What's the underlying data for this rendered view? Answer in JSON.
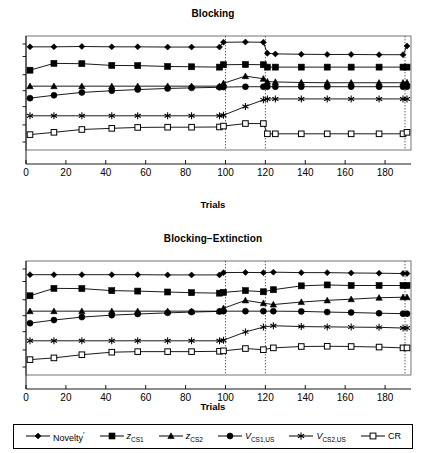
{
  "figure": {
    "width": 426,
    "height": 453,
    "background": "#ffffff",
    "line_color": "#000000",
    "gridline_color": "#555555"
  },
  "legend": {
    "name": "series-legend",
    "position": "bottom",
    "border": true,
    "entries": [
      {
        "key": "novelty",
        "label": "Novelty'",
        "marker": "diamond",
        "marker_filled": true
      },
      {
        "key": "z_cs1",
        "label": "zCS1",
        "marker": "square",
        "marker_filled": true
      },
      {
        "key": "z_cs2",
        "label": "zCS2",
        "marker": "triangle",
        "marker_filled": true
      },
      {
        "key": "v_cs1_us",
        "label": "VCS1,US",
        "marker": "circle",
        "marker_filled": true
      },
      {
        "key": "v_cs2_us",
        "label": "VCS2,US",
        "marker": "asterisk",
        "marker_filled": true
      },
      {
        "key": "cr",
        "label": "CR",
        "marker": "square-open",
        "marker_filled": false
      }
    ]
  },
  "chart_data": [
    {
      "id": "blocking",
      "type": "line",
      "title": "Blocking",
      "xlabel": "Trials",
      "ylabel": "",
      "xlim": [
        0,
        193
      ],
      "ylim": [
        0,
        1
      ],
      "xticks": [
        0,
        20,
        40,
        60,
        80,
        100,
        120,
        140,
        160,
        180
      ],
      "xticklabels": [
        "0",
        "20",
        "40",
        "60",
        "80",
        "100",
        "120",
        "140",
        "160",
        "180"
      ],
      "yticks": [
        0.07,
        0.22,
        0.38,
        0.52,
        0.66,
        0.82,
        0.93
      ],
      "yticklabels": [
        "",
        "",
        "",
        "",
        "",
        "",
        ""
      ],
      "grid": false,
      "vlines": [
        100,
        120,
        190
      ],
      "vline_style": "dotted",
      "x": [
        2,
        14,
        28,
        43,
        56,
        71,
        83,
        97,
        99,
        110,
        119,
        121,
        125,
        138,
        151,
        163,
        177,
        189,
        191
      ],
      "series": [
        {
          "name": "Novelty'",
          "marker": "diamond",
          "values": [
            0.905,
            0.905,
            0.908,
            0.905,
            0.905,
            0.903,
            0.903,
            0.903,
            0.945,
            0.947,
            0.945,
            0.848,
            0.843,
            0.84,
            0.838,
            0.838,
            0.836,
            0.836,
            0.912
          ]
        },
        {
          "name": "zCS1",
          "marker": "square",
          "values": [
            0.7,
            0.76,
            0.757,
            0.742,
            0.74,
            0.733,
            0.73,
            0.727,
            0.748,
            0.75,
            0.748,
            0.727,
            0.727,
            0.727,
            0.727,
            0.727,
            0.727,
            0.727,
            0.727
          ]
        },
        {
          "name": "zCS2",
          "marker": "triangle",
          "values": [
            0.56,
            0.56,
            0.56,
            0.56,
            0.56,
            0.56,
            0.56,
            0.56,
            0.585,
            0.648,
            0.625,
            0.6,
            0.597,
            0.592,
            0.59,
            0.59,
            0.59,
            0.59,
            0.592
          ]
        },
        {
          "name": "VCS1,US",
          "marker": "circle",
          "values": [
            0.455,
            0.48,
            0.505,
            0.52,
            0.53,
            0.54,
            0.545,
            0.55,
            0.552,
            0.555,
            0.555,
            0.555,
            0.555,
            0.555,
            0.555,
            0.555,
            0.555,
            0.555,
            0.555
          ]
        },
        {
          "name": "VCS2,US",
          "marker": "asterisk",
          "values": [
            0.3,
            0.3,
            0.3,
            0.3,
            0.3,
            0.3,
            0.3,
            0.3,
            0.305,
            0.382,
            0.44,
            0.448,
            0.448,
            0.448,
            0.448,
            0.448,
            0.448,
            0.448,
            0.448
          ]
        },
        {
          "name": "CR",
          "marker": "square-open",
          "values": [
            0.135,
            0.155,
            0.18,
            0.19,
            0.198,
            0.2,
            0.2,
            0.202,
            0.21,
            0.232,
            0.232,
            0.142,
            0.142,
            0.142,
            0.142,
            0.142,
            0.142,
            0.142,
            0.155
          ]
        }
      ]
    },
    {
      "id": "blocking-extinction",
      "type": "line",
      "title": "Blocking−Extinction",
      "xlabel": "Trials",
      "ylabel": "",
      "xlim": [
        0,
        193
      ],
      "ylim": [
        0,
        1
      ],
      "xticks": [
        0,
        20,
        40,
        60,
        80,
        100,
        120,
        140,
        160,
        180
      ],
      "xticklabels": [
        "0",
        "20",
        "40",
        "60",
        "80",
        "100",
        "120",
        "140",
        "160",
        "180"
      ],
      "yticks": [
        0.07,
        0.22,
        0.38,
        0.52,
        0.66,
        0.82,
        0.93
      ],
      "yticklabels": [
        "",
        "",
        "",
        "",
        "",
        "",
        ""
      ],
      "grid": false,
      "vlines": [
        100,
        120,
        190
      ],
      "vline_style": "dotted",
      "x": [
        2,
        14,
        28,
        43,
        56,
        71,
        83,
        97,
        99,
        110,
        119,
        124,
        138,
        151,
        163,
        177,
        189,
        191
      ],
      "series": [
        {
          "name": "Novelty'",
          "marker": "diamond",
          "values": [
            0.88,
            0.88,
            0.88,
            0.88,
            0.88,
            0.878,
            0.878,
            0.878,
            0.898,
            0.9,
            0.898,
            0.902,
            0.898,
            0.898,
            0.895,
            0.893,
            0.89,
            0.89
          ]
        },
        {
          "name": "zCS1",
          "marker": "square",
          "values": [
            0.695,
            0.76,
            0.758,
            0.74,
            0.736,
            0.728,
            0.722,
            0.718,
            0.725,
            0.74,
            0.73,
            0.748,
            0.782,
            0.79,
            0.785,
            0.785,
            0.785,
            0.785
          ]
        },
        {
          "name": "zCS2",
          "marker": "triangle",
          "values": [
            0.56,
            0.56,
            0.56,
            0.56,
            0.56,
            0.56,
            0.56,
            0.56,
            0.585,
            0.655,
            0.63,
            0.618,
            0.64,
            0.655,
            0.665,
            0.678,
            0.682,
            0.682
          ]
        },
        {
          "name": "VCS1,US",
          "marker": "circle",
          "values": [
            0.455,
            0.482,
            0.508,
            0.525,
            0.535,
            0.545,
            0.552,
            0.558,
            0.56,
            0.56,
            0.56,
            0.56,
            0.558,
            0.552,
            0.548,
            0.542,
            0.538,
            0.538
          ]
        },
        {
          "name": "VCS2,US",
          "marker": "asterisk",
          "values": [
            0.3,
            0.3,
            0.3,
            0.3,
            0.3,
            0.3,
            0.3,
            0.3,
            0.305,
            0.378,
            0.42,
            0.432,
            0.425,
            0.422,
            0.42,
            0.418,
            0.412,
            0.412
          ]
        },
        {
          "name": "CR",
          "marker": "square-open",
          "values": [
            0.135,
            0.15,
            0.178,
            0.2,
            0.205,
            0.205,
            0.205,
            0.208,
            0.212,
            0.232,
            0.222,
            0.238,
            0.25,
            0.252,
            0.25,
            0.245,
            0.238,
            0.238
          ]
        }
      ]
    }
  ]
}
